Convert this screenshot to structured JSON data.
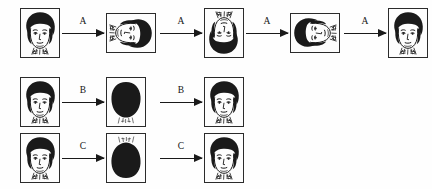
{
  "figure": {
    "background_color": "#ffffff",
    "ink_color": "#1a1a1a",
    "panel_border_color": "#2b2b2b"
  },
  "rows": [
    {
      "id": "row-a",
      "operation_label": "A",
      "y": 8,
      "steps": [
        {
          "kind": "panel",
          "name": "face-upright-a0",
          "x": 20,
          "orient": "portrait",
          "rotation": 0,
          "polarity": "normal",
          "alt": "upright line-drawing face"
        },
        {
          "kind": "arrow",
          "name": "arrow-a1",
          "x": 62,
          "width": 42,
          "label": "A"
        },
        {
          "kind": "panel",
          "name": "face-rotated-90-a1",
          "x": 106,
          "orient": "landscape",
          "rotation": 90,
          "polarity": "normal",
          "alt": "face rotated 90 degrees"
        },
        {
          "kind": "arrow",
          "name": "arrow-a2",
          "x": 160,
          "width": 42,
          "label": "A"
        },
        {
          "kind": "panel",
          "name": "face-rotated-180-a2",
          "x": 204,
          "orient": "portrait",
          "rotation": 180,
          "polarity": "normal",
          "alt": "face rotated 180 degrees, inverted"
        },
        {
          "kind": "arrow",
          "name": "arrow-a3",
          "x": 246,
          "width": 42,
          "label": "A"
        },
        {
          "kind": "panel",
          "name": "face-rotated-270-a3",
          "x": 290,
          "orient": "landscape",
          "rotation": 270,
          "polarity": "normal",
          "alt": "face rotated 270 degrees"
        },
        {
          "kind": "arrow",
          "name": "arrow-a4",
          "x": 344,
          "width": 42,
          "label": "A"
        },
        {
          "kind": "panel",
          "name": "face-upright-a4",
          "x": 388,
          "orient": "portrait",
          "rotation": 0,
          "polarity": "normal",
          "alt": "upright face restored"
        }
      ]
    },
    {
      "id": "row-b",
      "operation_label": "B",
      "y": 77,
      "steps": [
        {
          "kind": "panel",
          "name": "face-upright-b0",
          "x": 20,
          "orient": "portrait",
          "rotation": 0,
          "polarity": "normal",
          "alt": "upright line-drawing face"
        },
        {
          "kind": "arrow",
          "name": "arrow-b1",
          "x": 62,
          "width": 42,
          "label": "B"
        },
        {
          "kind": "panel",
          "name": "face-silhouette-b1",
          "x": 106,
          "orient": "portrait",
          "rotation": 0,
          "polarity": "silhouette",
          "alt": "face filled solid black, collar detail visible below"
        },
        {
          "kind": "arrow",
          "name": "arrow-b2",
          "x": 160,
          "width": 42,
          "label": "B"
        },
        {
          "kind": "panel",
          "name": "face-upright-b2",
          "x": 204,
          "orient": "portrait",
          "rotation": 0,
          "polarity": "normal",
          "alt": "upright face restored"
        }
      ]
    },
    {
      "id": "row-c",
      "operation_label": "C",
      "y": 133,
      "steps": [
        {
          "kind": "panel",
          "name": "face-upright-c0",
          "x": 20,
          "orient": "portrait",
          "rotation": 0,
          "polarity": "normal",
          "alt": "upright line-drawing face"
        },
        {
          "kind": "arrow",
          "name": "arrow-c1",
          "x": 62,
          "width": 42,
          "label": "C"
        },
        {
          "kind": "panel",
          "name": "face-silhouette-c1",
          "x": 106,
          "orient": "portrait",
          "rotation": 180,
          "polarity": "silhouette",
          "alt": "face filled solid black and inverted, collar detail above"
        },
        {
          "kind": "arrow",
          "name": "arrow-c2",
          "x": 160,
          "width": 42,
          "label": "C"
        },
        {
          "kind": "panel",
          "name": "face-upright-c2",
          "x": 204,
          "orient": "portrait",
          "rotation": 0,
          "polarity": "normal",
          "alt": "upright face restored"
        }
      ]
    }
  ]
}
